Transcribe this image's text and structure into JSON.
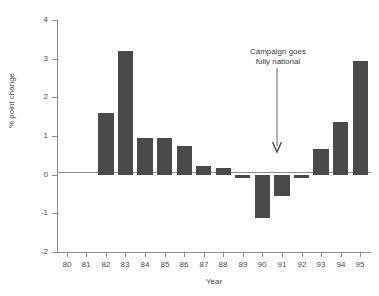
{
  "chart_data": {
    "type": "bar",
    "title": "",
    "subtitle": "",
    "xlabel": "Year",
    "ylabel": "% point change",
    "categories": [
      "80",
      "81",
      "82",
      "83",
      "84",
      "85",
      "86",
      "87",
      "88",
      "89",
      "90",
      "91",
      "92",
      "93",
      "94",
      "95"
    ],
    "values": [
      0,
      0,
      1.6,
      3.2,
      0.95,
      0.95,
      0.75,
      0.23,
      0.18,
      -0.08,
      -1.13,
      -0.55,
      -0.08,
      0.67,
      1.35,
      2.95
    ],
    "ylim": [
      -2,
      4
    ],
    "ytick_labels": [
      "4",
      "3",
      "2",
      "1",
      "0",
      "-1",
      "-2"
    ],
    "ytick_values": [
      4,
      3,
      2,
      1,
      0,
      -1,
      -2
    ],
    "grid": false,
    "legend": "none",
    "bar_color": "#4a4a4a",
    "axis_color": "#8d8d8d",
    "background_color": "#ffffff",
    "annotations": [
      {
        "id": "campaign-national",
        "line1": "Campaign goes",
        "line2": "fully national",
        "points_to_category": "91",
        "arrow": "down-arrow"
      }
    ]
  }
}
